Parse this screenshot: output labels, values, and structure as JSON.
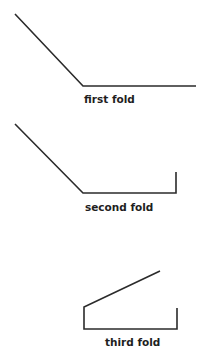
{
  "diagram": {
    "stroke_color": "#2b2b2b",
    "label_color": "#1e1e1e",
    "steps": [
      {
        "label": "first fold",
        "path": "M15,14 L83,86 L196,86",
        "label_x": 84,
        "label_y": 103
      },
      {
        "label": "second fold",
        "path": "M15,124 L83,193 L176,193 L176,172",
        "label_x": 85,
        "label_y": 211
      },
      {
        "label": "third fold",
        "path": "M160,271 L84,307 L84,329 L177,329 L177,308",
        "label_x": 105,
        "label_y": 346
      }
    ]
  }
}
